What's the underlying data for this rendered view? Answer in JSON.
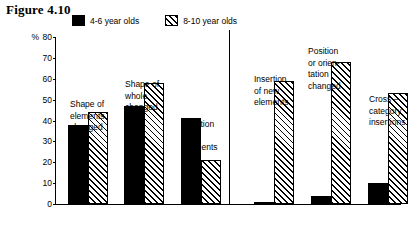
{
  "figure": {
    "title": "Figure 4.10"
  },
  "legend": {
    "items": [
      {
        "label": "4-6 year olds",
        "pattern": "solid",
        "color": "#000000"
      },
      {
        "label": "8-10 year olds",
        "pattern": "hatch",
        "color": "#000000"
      }
    ]
  },
  "axis": {
    "unit": "%",
    "ticks": [
      "80",
      "70",
      "60",
      "50",
      "40",
      "30",
      "20",
      "10",
      "0"
    ]
  },
  "chart_data": {
    "type": "bar",
    "title": "Figure 4.10",
    "xlabel": "",
    "ylabel": "%",
    "ylim": [
      0,
      80
    ],
    "grid": false,
    "legend_position": "top",
    "categories": [
      "Shape of elements changed",
      "Shape of whole changed",
      "Deletion of elements",
      "Insertion of new elements",
      "Position or orientation changed",
      "Cross – category insertions"
    ],
    "series": [
      {
        "name": "4-6 year olds",
        "values": [
          38,
          47,
          41,
          1,
          4,
          10
        ]
      },
      {
        "name": "8-10 year olds",
        "values": [
          44,
          58,
          21,
          59,
          68,
          53
        ]
      }
    ],
    "panels": [
      {
        "name": "left-panel",
        "categories": [
          0,
          1,
          2
        ]
      },
      {
        "name": "right-panel",
        "categories": [
          3,
          4,
          5
        ]
      }
    ]
  },
  "captions": [
    {
      "text": "Shape of\nelements\nchanged"
    },
    {
      "text": "Shape of\nwhole\nchanged"
    },
    {
      "text": "Deletion\nof\nelements"
    },
    {
      "text": "Insertion\nof new\nelements"
    },
    {
      "text": "Position\nor orien-\ntation\nchanged"
    },
    {
      "text": "Cross –\ncategory\ninsertions"
    }
  ]
}
